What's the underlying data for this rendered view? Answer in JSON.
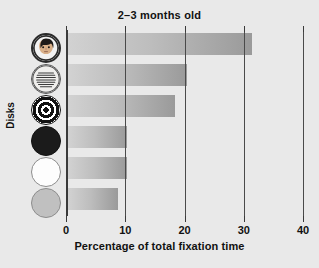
{
  "chart_data": {
    "type": "bar",
    "orientation": "horizontal",
    "title": "2–3 months old",
    "xlabel": "Percentage of total fixation time",
    "ylabel": "Disks",
    "xlim": [
      0,
      40
    ],
    "xticks": [
      0,
      10,
      20,
      30,
      40
    ],
    "xtick_labels": [
      "0",
      "10",
      "20",
      "30",
      "40"
    ],
    "grid": true,
    "legend": "none",
    "categories": [
      "face",
      "newsprint",
      "bullseye",
      "black",
      "white",
      "gray"
    ],
    "category_labels": [
      "Face disk",
      "Newsprint disk",
      "Bullseye disk",
      "Black disk",
      "White disk",
      "Gray disk"
    ],
    "values": [
      31,
      20,
      18,
      10,
      10,
      8.5
    ]
  },
  "axis": {
    "x_title": "Percentage of total fixation time",
    "y_title": "Disks",
    "ticks": [
      {
        "label": "0",
        "value": 0
      },
      {
        "label": "10",
        "value": 10
      },
      {
        "label": "20",
        "value": 20
      },
      {
        "label": "30",
        "value": 30
      },
      {
        "label": "40",
        "value": 40
      }
    ]
  },
  "header": {
    "title": "2–3 months old"
  },
  "colors": {
    "background": "#e9e9e9",
    "bar_light": "#d2d2d2",
    "bar_dark": "#9a9a9a",
    "axis": "#3a3a3a",
    "text": "#111111"
  },
  "disks": [
    {
      "name": "face-disk",
      "icon": "face-disk-icon"
    },
    {
      "name": "newsprint-disk",
      "icon": "newsprint-disk-icon"
    },
    {
      "name": "bullseye-disk",
      "icon": "bullseye-disk-icon"
    },
    {
      "name": "black-disk",
      "icon": "black-disk-icon"
    },
    {
      "name": "white-disk",
      "icon": "white-disk-icon"
    },
    {
      "name": "gray-disk",
      "icon": "gray-disk-icon"
    }
  ]
}
